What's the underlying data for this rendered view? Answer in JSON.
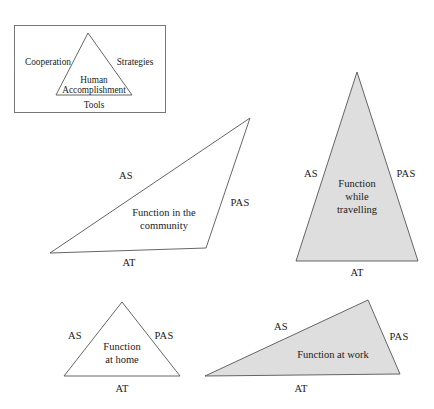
{
  "figure": {
    "width": 434,
    "height": 409,
    "background": "#ffffff",
    "stroke_color": "#555555",
    "text_color": "#1a1a1a",
    "fill_shaded": "#dedede",
    "fill_plain": "#ffffff"
  },
  "legend": {
    "box_border_color": "#777777",
    "left_label": "Cooperation",
    "right_label": "Strategies",
    "center_label_line1": "Human",
    "center_label_line2": "Accomplishment",
    "bottom_label": "Tools"
  },
  "triangles": [
    {
      "id": "community",
      "body_line1": "Function in the",
      "body_line2": "community",
      "side_left": "AS",
      "side_right": "PAS",
      "side_bottom": "AT",
      "fill": "#ffffff",
      "shaded": "no"
    },
    {
      "id": "travelling",
      "body_line1": "Function",
      "body_line2": "while",
      "body_line3": "travelling",
      "side_left": "AS",
      "side_right": "PAS",
      "side_bottom": "AT",
      "fill": "#dedede",
      "shaded": "yes"
    },
    {
      "id": "home",
      "body_line1": "Function",
      "body_line2": "at home",
      "side_left": "AS",
      "side_right": "PAS",
      "side_bottom": "AT",
      "fill": "#ffffff",
      "shaded": "no"
    },
    {
      "id": "work",
      "body_line1": "Function at work",
      "side_left": "AS",
      "side_right": "PAS",
      "side_bottom": "AT",
      "fill": "#dedede",
      "shaded": "yes"
    }
  ]
}
